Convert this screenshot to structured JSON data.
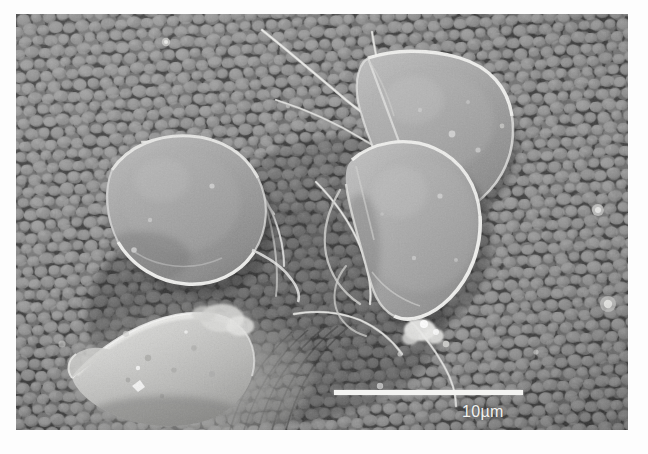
{
  "figure": {
    "kind": "sem-micrograph",
    "background_tone": "#6a6a6a",
    "border_margin_color": "#ffffff"
  },
  "scalebar": {
    "label": "10µm",
    "length_px": 189,
    "bar_color": "#f4f4f2",
    "text_color": "#f2f2f0"
  },
  "specimens": [
    {
      "id": "trophozoite-upper-right",
      "shape": "teardrop",
      "fill": "#9a9a9a",
      "rim": "#e8e8e6",
      "note": "pear-shaped cell, anterior toward upper left"
    },
    {
      "id": "trophozoite-left",
      "shape": "oval",
      "fill": "#909090",
      "rim": "#e4e4e2",
      "note": "rounded oval cell with bright ventral rim"
    },
    {
      "id": "trophozoite-center-right",
      "shape": "teardrop",
      "fill": "#9d9d9d",
      "rim": "#ececea",
      "note": "large pear-shaped cell, tail toward lower left"
    },
    {
      "id": "conical-structure-lower-left",
      "shape": "cone",
      "fill": "#c8c8c6",
      "rim": "#eeeeec",
      "note": "bright elongated conical body at lower left"
    }
  ],
  "features": {
    "flagella_color": "#e6e6e4",
    "debris_color": "#f0f0ee",
    "epithelium_cell_fill": "#888888",
    "epithelium_crevice": "#3a3a3a"
  },
  "colors": {
    "page_background": "#ffffff",
    "plate_dark": "#4a4a4a",
    "plate_mid": "#8c8c8c",
    "plate_light": "#d4d4d4"
  }
}
